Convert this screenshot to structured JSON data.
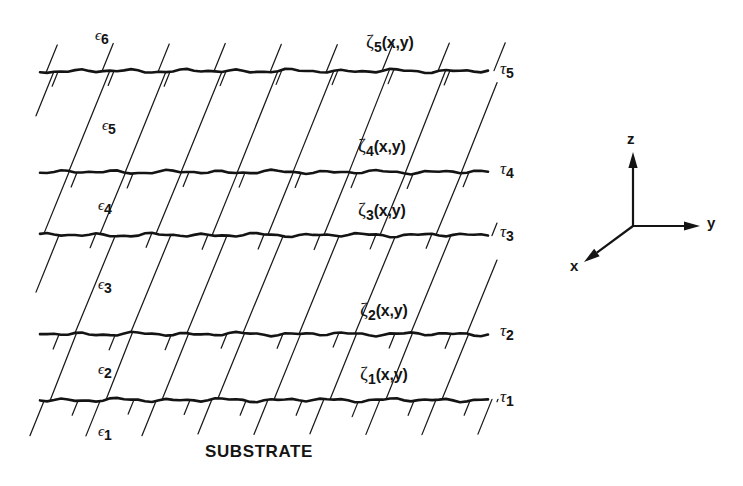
{
  "figure": {
    "kind": "layered-film-stack-cross-section",
    "background_color": "#ffffff",
    "ink_color": "#1a1a1a",
    "substrate_label": "SUBSTRATE",
    "interface_line_x_start": 40,
    "interface_line_x_end": 493,
    "hatch_angle_deg": 68,
    "permittivity_labels": [
      {
        "symbol": "ϵ",
        "subscript": "1",
        "x": 98,
        "y": 424
      },
      {
        "symbol": "ϵ",
        "subscript": "2",
        "x": 98,
        "y": 362
      },
      {
        "symbol": "ϵ",
        "subscript": "3",
        "x": 98,
        "y": 277
      },
      {
        "symbol": "ϵ",
        "subscript": "4",
        "x": 98,
        "y": 198
      },
      {
        "symbol": "ϵ",
        "subscript": "5",
        "x": 102,
        "y": 118
      },
      {
        "symbol": "ϵ",
        "subscript": "6",
        "x": 95,
        "y": 28
      }
    ],
    "interface_labels": [
      {
        "symbol": "τ",
        "subscript": "1",
        "x": 500,
        "y": 388
      },
      {
        "symbol": "τ",
        "subscript": "2",
        "x": 500,
        "y": 322
      },
      {
        "symbol": "τ",
        "subscript": "3",
        "x": 500,
        "y": 223
      },
      {
        "symbol": "τ",
        "subscript": "4",
        "x": 500,
        "y": 160
      },
      {
        "symbol": "τ",
        "subscript": "5",
        "x": 500,
        "y": 60
      }
    ],
    "roughness_labels": [
      {
        "symbol": "ζ",
        "subscript": "1",
        "args": "(x,y)",
        "x": 360,
        "y": 364
      },
      {
        "symbol": "ζ",
        "subscript": "2",
        "args": "(x,y)",
        "x": 360,
        "y": 300
      },
      {
        "symbol": "ζ",
        "subscript": "3",
        "args": "(x,y)",
        "x": 358,
        "y": 200
      },
      {
        "symbol": "ζ",
        "subscript": "4",
        "args": "(x,y)",
        "x": 358,
        "y": 136
      },
      {
        "symbol": "ζ",
        "subscript": "5",
        "args": "(x,y)",
        "x": 366,
        "y": 32
      }
    ],
    "substrate_label_pos": {
      "x": 205,
      "y": 443
    },
    "interfaces": [
      {
        "name": "tau-5",
        "y": 71
      },
      {
        "name": "tau-4",
        "y": 172
      },
      {
        "name": "tau-3",
        "y": 235
      },
      {
        "name": "tau-2",
        "y": 334
      },
      {
        "name": "tau-1",
        "y": 400
      }
    ],
    "axes": {
      "origin": {
        "x": 633,
        "y": 226
      },
      "z": {
        "label": "z",
        "tip_x": 633,
        "tip_y": 152,
        "label_x": 627,
        "label_y": 131
      },
      "y": {
        "label": "y",
        "tip_x": 700,
        "tip_y": 226,
        "label_x": 707,
        "label_y": 215
      },
      "x": {
        "label": "x",
        "tip_x": 584,
        "tip_y": 262,
        "label_x": 570,
        "label_y": 258
      }
    }
  }
}
